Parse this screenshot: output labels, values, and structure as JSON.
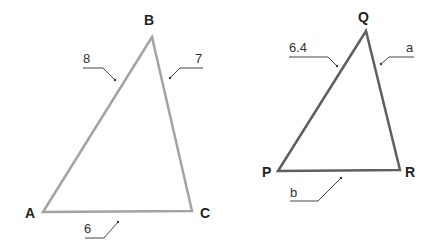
{
  "diagram": {
    "type": "similar-triangles",
    "colors": {
      "triangle_abc_stroke": "#a3a3a3",
      "triangle_pqr_stroke": "#5f5f5f",
      "leader_stroke": "#444444",
      "text": "#222222"
    },
    "triangle_abc": {
      "vertices": {
        "A": {
          "label": "A",
          "x": 43,
          "y": 212
        },
        "B": {
          "label": "B",
          "x": 152,
          "y": 37
        },
        "C": {
          "label": "C",
          "x": 192,
          "y": 211
        }
      },
      "sides": {
        "AB": {
          "label": "8"
        },
        "BC": {
          "label": "7"
        },
        "AC": {
          "label": "6"
        }
      }
    },
    "triangle_pqr": {
      "vertices": {
        "P": {
          "label": "P",
          "x": 278,
          "y": 171
        },
        "Q": {
          "label": "Q",
          "x": 366,
          "y": 31
        },
        "R": {
          "label": "R",
          "x": 400,
          "y": 170
        }
      },
      "sides": {
        "PQ": {
          "label": "6.4"
        },
        "QR": {
          "label": "a"
        },
        "PR": {
          "label": "b"
        }
      }
    }
  }
}
